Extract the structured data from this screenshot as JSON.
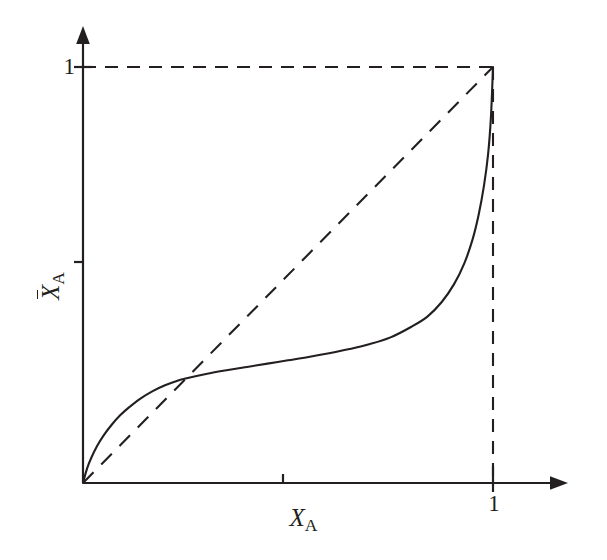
{
  "figure": {
    "background_color": "#ffffff",
    "ink_color": "#231f20"
  },
  "axes": {
    "x_axis": {
      "title_var": "X",
      "title_sub": "A",
      "tick_label_one": "1",
      "unlabeled_tick_position": 0.5,
      "labeled_tick_position": 1,
      "has_arrowhead": true
    },
    "y_axis": {
      "title_var": "X",
      "title_sub": "A",
      "title_has_overbar": true,
      "tick_label_one": "1",
      "unlabeled_tick_position": 0.5,
      "labeled_tick_position": 1,
      "has_arrowhead": true
    }
  },
  "chart_data": {
    "type": "line",
    "title": "",
    "subtitle": "",
    "xlabel": "X_A",
    "ylabel": "X̄_A (X_A with overbar)",
    "xlim": [
      0,
      1.18
    ],
    "ylim": [
      0,
      1.1
    ],
    "grid": false,
    "legend": null,
    "legend_position": "none",
    "xticks": [
      0.5,
      1.0
    ],
    "xticklabels": [
      "",
      "1"
    ],
    "yticks": [
      0.5,
      1.0
    ],
    "yticklabels": [
      "",
      "1"
    ],
    "series": [
      {
        "name": "conversion curve",
        "style": "solid",
        "color": "#231f20",
        "linewidth": 2.1,
        "x": [
          0.0,
          0.01,
          0.02,
          0.035,
          0.05,
          0.07,
          0.09,
          0.11,
          0.14,
          0.17,
          0.2,
          0.225,
          0.25,
          0.3,
          0.35,
          0.4,
          0.45,
          0.5,
          0.55,
          0.6,
          0.65,
          0.7,
          0.75,
          0.8,
          0.84,
          0.875,
          0.905,
          0.93,
          0.95,
          0.965,
          0.978,
          0.988,
          0.995,
          1.0
        ],
        "y": [
          0.0,
          0.035,
          0.06,
          0.09,
          0.114,
          0.14,
          0.162,
          0.18,
          0.203,
          0.221,
          0.235,
          0.244,
          0.251,
          0.262,
          0.271,
          0.279,
          0.287,
          0.295,
          0.303,
          0.312,
          0.322,
          0.334,
          0.35,
          0.375,
          0.4,
          0.435,
          0.478,
          0.528,
          0.585,
          0.645,
          0.715,
          0.79,
          0.88,
          1.0
        ]
      },
      {
        "name": "45-degree diagonal reference",
        "style": "dashed",
        "color": "#231f20",
        "linewidth": 2.1,
        "x": [
          0,
          1
        ],
        "y": [
          0,
          1
        ]
      },
      {
        "name": "horizontal guide at y = 1",
        "style": "dashed",
        "color": "#231f20",
        "linewidth": 2.1,
        "x": [
          0,
          1
        ],
        "y": [
          1,
          1
        ]
      },
      {
        "name": "vertical guide at x = 1",
        "style": "dashed",
        "color": "#231f20",
        "linewidth": 2.1,
        "x": [
          1,
          1
        ],
        "y": [
          0,
          1
        ]
      }
    ],
    "annotations": [
      {
        "text": "1",
        "axis": "y",
        "value": 1
      },
      {
        "text": "1",
        "axis": "x",
        "value": 1
      }
    ]
  }
}
